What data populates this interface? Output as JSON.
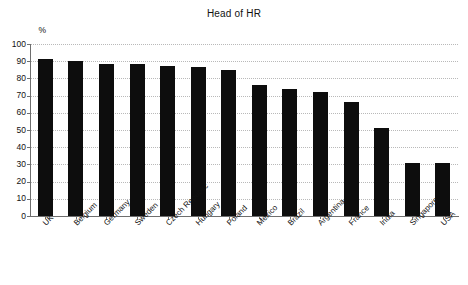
{
  "chart_data": {
    "type": "bar",
    "title": "Head of HR",
    "xlabel": "",
    "ylabel": "%",
    "ylim": [
      0,
      100
    ],
    "yticks": [
      0,
      10,
      20,
      30,
      40,
      50,
      60,
      70,
      80,
      90,
      100
    ],
    "grid": true,
    "legend": null,
    "bar_color": "#0d0d0d",
    "categories": [
      "UK",
      "Belgium",
      "Germany",
      "Sweden",
      "Czech Republic",
      "Hungary",
      "Poland",
      "Mexico",
      "Brazil",
      "Argentina",
      "France",
      "India",
      "Singapore",
      "USA"
    ],
    "values": [
      91,
      90,
      88.5,
      88.5,
      87.5,
      86.5,
      85,
      76,
      74,
      72,
      66,
      51,
      31,
      31
    ]
  }
}
